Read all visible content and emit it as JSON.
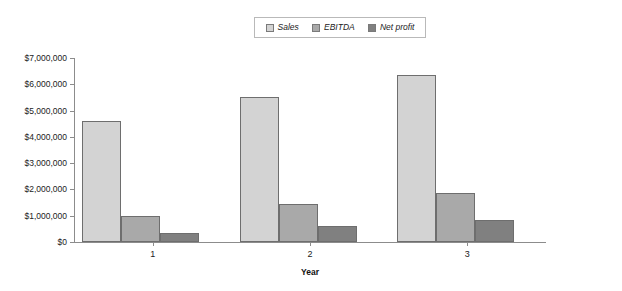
{
  "chart_data": {
    "type": "bar",
    "title": "",
    "xlabel": "Year",
    "ylabel": "",
    "categories": [
      "1",
      "2",
      "3"
    ],
    "series": [
      {
        "name": "Sales",
        "color": "#d3d3d3",
        "values": [
          4600000,
          5500000,
          6350000
        ]
      },
      {
        "name": "EBITDA",
        "color": "#a9a9a9",
        "values": [
          1000000,
          1450000,
          1850000
        ]
      },
      {
        "name": "Net profit",
        "color": "#808080",
        "values": [
          350000,
          600000,
          850000
        ]
      }
    ],
    "ylim": [
      0,
      7000000
    ],
    "ytick_values": [
      0,
      1000000,
      2000000,
      3000000,
      4000000,
      5000000,
      6000000,
      7000000
    ],
    "ytick_labels": [
      "$0",
      "$1,000,000",
      "$2,000,000",
      "$3,000,000",
      "$4,000,000",
      "$5,000,000",
      "$6,000,000",
      "$7,000,000"
    ],
    "grid": false,
    "legend_position": "top-center"
  },
  "legend": {
    "entries": [
      {
        "label": "Sales"
      },
      {
        "label": "EBITDA"
      },
      {
        "label": "Net profit"
      }
    ]
  },
  "axes": {
    "x_title": "Year"
  },
  "colors": {
    "axis": "#8c8c8c",
    "bar_outline": "#6e6e6e",
    "background": "#ffffff",
    "text": "#222222"
  }
}
